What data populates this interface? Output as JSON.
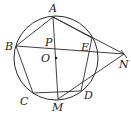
{
  "figure": {
    "circle": {
      "center_label": "O",
      "cx": 56,
      "cy": 58,
      "r": 42
    },
    "points": [
      {
        "name": "A",
        "x": 53,
        "y": 17,
        "label_x": 49,
        "label_y": 12
      },
      {
        "name": "B",
        "x": 16,
        "y": 46,
        "label_x": 5,
        "label_y": 50
      },
      {
        "name": "C",
        "x": 33,
        "y": 93,
        "label_x": 20,
        "label_y": 105
      },
      {
        "name": "M",
        "x": 58,
        "y": 99,
        "label_x": 52,
        "label_y": 111
      },
      {
        "name": "D",
        "x": 81,
        "y": 91,
        "label_x": 84,
        "label_y": 99
      },
      {
        "name": "E",
        "x": 92,
        "y": 38,
        "label_x": 81,
        "label_y": 51
      },
      {
        "name": "N",
        "x": 124,
        "y": 54,
        "label_x": 119,
        "label_y": 68
      },
      {
        "name": "P",
        "x": 54,
        "y": 48,
        "label_x": 45,
        "label_y": 46
      },
      {
        "name": "O",
        "x": 56,
        "y": 58,
        "label_x": 41,
        "label_y": 62
      }
    ],
    "labels": {
      "A": "A",
      "B": "B",
      "C": "C",
      "D": "D",
      "E": "E",
      "M": "M",
      "N": "N",
      "O": "O",
      "P": "P"
    }
  }
}
